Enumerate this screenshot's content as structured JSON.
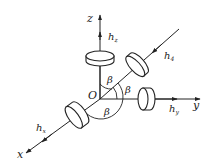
{
  "figure": {
    "origin_label": "O",
    "axes": [
      {
        "id": "x",
        "label": "x",
        "momentum_label": "h",
        "momentum_sub": "x"
      },
      {
        "id": "y",
        "label": "y",
        "momentum_label": "h",
        "momentum_sub": "y"
      },
      {
        "id": "z",
        "label": "z",
        "momentum_label": "h",
        "momentum_sub": "z"
      },
      {
        "id": "skew",
        "label": "",
        "momentum_label": "h",
        "momentum_sub": "4"
      }
    ],
    "angle_label": "β",
    "angle_count": 3,
    "colors": {
      "ink": "#222222",
      "background": "#ffffff"
    }
  }
}
